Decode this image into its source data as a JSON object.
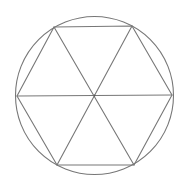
{
  "diagram": {
    "width": 186,
    "height": 189,
    "background": "#ffffff",
    "stroke_color": "#777777",
    "stroke_width": 1.1,
    "circle": {
      "cx": 94.5,
      "cy": 95.5,
      "r": 79
    },
    "center": {
      "x": 94.5,
      "y": 95.5
    },
    "vertices": [
      {
        "name": "left",
        "x": 17,
        "y": 96
      },
      {
        "name": "top-left",
        "x": 54,
        "y": 27
      },
      {
        "name": "top-right",
        "x": 132,
        "y": 26
      },
      {
        "name": "right",
        "x": 172,
        "y": 95
      },
      {
        "name": "bottom-right",
        "x": 134,
        "y": 165
      },
      {
        "name": "bottom-left",
        "x": 57,
        "y": 165
      }
    ],
    "diagonals": [
      {
        "name": "horizontal",
        "from": "left",
        "to": "right"
      },
      {
        "name": "falling",
        "from": "top-left",
        "to": "bottom-right"
      },
      {
        "name": "rising",
        "from": "bottom-left",
        "to": "top-right"
      }
    ]
  }
}
